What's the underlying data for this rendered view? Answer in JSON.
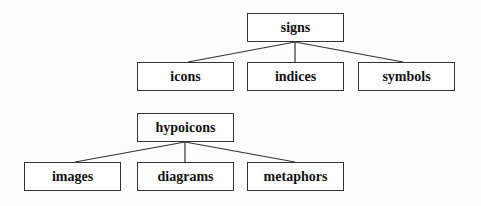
{
  "diagram": {
    "trees": [
      {
        "root": {
          "label": "signs",
          "x": 247,
          "y": 13,
          "w": 97,
          "h": 29
        },
        "children": [
          {
            "label": "icons",
            "x": 137,
            "y": 62,
            "w": 97,
            "h": 29
          },
          {
            "label": "indices",
            "x": 247,
            "y": 62,
            "w": 97,
            "h": 29
          },
          {
            "label": "symbols",
            "x": 358,
            "y": 62,
            "w": 97,
            "h": 29
          }
        ]
      },
      {
        "root": {
          "label": "hypoicons",
          "x": 137,
          "y": 113,
          "w": 97,
          "h": 29
        },
        "children": [
          {
            "label": "images",
            "x": 24,
            "y": 162,
            "w": 97,
            "h": 29
          },
          {
            "label": "diagrams",
            "x": 137,
            "y": 162,
            "w": 97,
            "h": 29
          },
          {
            "label": "metaphors",
            "x": 247,
            "y": 162,
            "w": 97,
            "h": 29
          }
        ]
      }
    ]
  }
}
